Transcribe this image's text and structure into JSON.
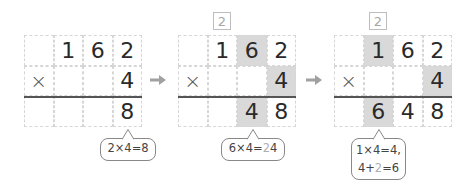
{
  "colors": {
    "shade": "#d9d9d9",
    "grid_line": "#d6d6d6",
    "rule": "#555555",
    "arrow": "#a0a0a0",
    "carry": "#a8a8a8",
    "bubble_border": "#888888"
  },
  "steps": [
    {
      "carry": null,
      "rows": [
        [
          "",
          "1",
          "6",
          "2"
        ],
        [
          "×",
          "",
          "",
          "4"
        ],
        [
          "",
          "",
          "",
          "8"
        ]
      ],
      "shaded": [],
      "bubble": {
        "lines": [
          {
            "parts": [
              {
                "t": "2×4=8",
                "hl": false
              }
            ]
          }
        ]
      }
    },
    {
      "carry": "2",
      "rows": [
        [
          "",
          "1",
          "6",
          "2"
        ],
        [
          "×",
          "",
          "",
          "4"
        ],
        [
          "",
          "",
          "4",
          "8"
        ]
      ],
      "shaded": [
        [
          0,
          2
        ],
        [
          1,
          3
        ],
        [
          2,
          2
        ]
      ],
      "bubble": {
        "lines": [
          {
            "parts": [
              {
                "t": "6×4=",
                "hl": false
              },
              {
                "t": "2",
                "hl": true
              },
              {
                "t": "4",
                "hl": false
              }
            ]
          }
        ]
      }
    },
    {
      "carry": "2",
      "rows": [
        [
          "",
          "1",
          "6",
          "2"
        ],
        [
          "×",
          "",
          "",
          "4"
        ],
        [
          "",
          "6",
          "4",
          "8"
        ]
      ],
      "shaded": [
        [
          0,
          1
        ],
        [
          1,
          3
        ],
        [
          2,
          1
        ]
      ],
      "bubble": {
        "lines": [
          {
            "parts": [
              {
                "t": "1×4=4,",
                "hl": false
              }
            ]
          },
          {
            "parts": [
              {
                "t": "4+",
                "hl": false
              },
              {
                "t": "2",
                "hl": true
              },
              {
                "t": "=6",
                "hl": false
              }
            ]
          }
        ]
      }
    }
  ],
  "arrows": [
    "arrow-right",
    "arrow-right"
  ]
}
